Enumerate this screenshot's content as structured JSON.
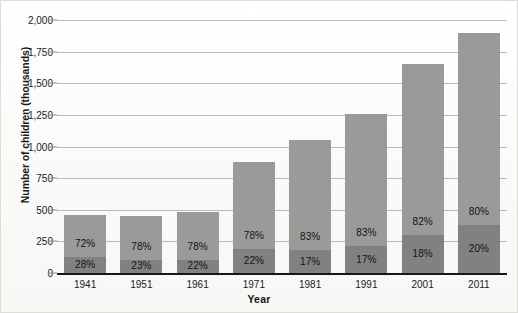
{
  "chart_data": {
    "type": "bar",
    "subtype": "stacked-bar-percent",
    "title": "",
    "xlabel": "Year",
    "ylabel": "Number of children (thousands)",
    "categories": [
      "1941",
      "1951",
      "1961",
      "1971",
      "1981",
      "1991",
      "2001",
      "2011"
    ],
    "values": [
      458,
      450,
      483,
      878,
      1050,
      1255,
      1655,
      1900
    ],
    "ylim": [
      0,
      2000
    ],
    "ytick_values": [
      0,
      250,
      500,
      750,
      1000,
      1250,
      1500,
      1750,
      2000
    ],
    "ytick_labels": [
      "0",
      "250",
      "500",
      "750",
      "1,000",
      "1,250",
      "1,500",
      "1,750",
      "2,000"
    ],
    "grid": true,
    "legend": "none",
    "series": [
      {
        "name": "lower-segment",
        "color": "#818180",
        "labels": [
          "28%",
          "23%",
          "22%",
          "22%",
          "17%",
          "17%",
          "18%",
          "20%"
        ],
        "fractions": [
          0.28,
          0.23,
          0.22,
          0.22,
          0.17,
          0.17,
          0.18,
          0.2
        ]
      },
      {
        "name": "upper-segment",
        "color": "#9a9a99",
        "labels": [
          "72%",
          "78%",
          "78%",
          "78%",
          "83%",
          "83%",
          "82%",
          "80%"
        ],
        "fractions": [
          0.72,
          0.78,
          0.78,
          0.78,
          0.83,
          0.83,
          0.82,
          0.8
        ]
      }
    ]
  }
}
